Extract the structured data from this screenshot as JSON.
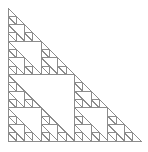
{
  "figure": {
    "type": "fractal-line-drawing",
    "canvas": {
      "width": 148,
      "height": 152,
      "background_color": "#ffffff"
    },
    "stroke": {
      "color": "#8c8c8c",
      "width": 1.0
    },
    "geometry": {
      "shape": "right-triangle",
      "orientation": "apex-top-left-right-angle-bottom-left",
      "apex": {
        "x": 8,
        "y": 8
      },
      "right_angle_corner": {
        "x": 8,
        "y": 141
      },
      "far_corner": {
        "x": 141,
        "y": 141
      },
      "leg_length": 133,
      "recursion_depth": 4,
      "smallest_triangle_size": 8.3125,
      "base_divisions": 16,
      "filled_triangle_count": 81
    },
    "labels": {
      "caption": "",
      "axis_visible": false,
      "legend_visible": false,
      "grid_visible": false
    }
  },
  "chart_data": {
    "type": "line",
    "xlabel": "",
    "ylabel": "",
    "xlim": [
      8,
      141
    ],
    "ylim": [
      8,
      141
    ],
    "grid": false,
    "legend": null,
    "annotations": [],
    "series": [
      {
        "name": "sierpinski-depth-4",
        "description": "Recursive right-triangle subdivision: each triangle split into 3 sub-triangles (top-left, bottom-left, bottom-right), the middle square omitted.",
        "depth": 4,
        "vertices": [
          {
            "x": 8,
            "y": 8
          },
          {
            "x": 8,
            "y": 141
          },
          {
            "x": 141,
            "y": 141
          }
        ]
      }
    ]
  }
}
